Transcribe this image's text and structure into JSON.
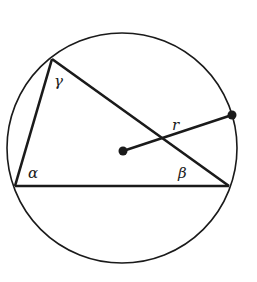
{
  "diagram": {
    "circle": {
      "cx": 122,
      "cy": 148,
      "r": 115
    },
    "center": {
      "x": 123,
      "y": 151
    },
    "vertices": {
      "A": {
        "x": 15,
        "y": 186
      },
      "B": {
        "x": 229,
        "y": 186
      },
      "C": {
        "x": 52,
        "y": 59
      }
    },
    "radius_endpoint": {
      "x": 232,
      "y": 115
    },
    "labels": {
      "alpha": "α",
      "beta": "β",
      "gamma": "γ",
      "radius": "r"
    },
    "stroke_color": "#1a1a1a"
  }
}
